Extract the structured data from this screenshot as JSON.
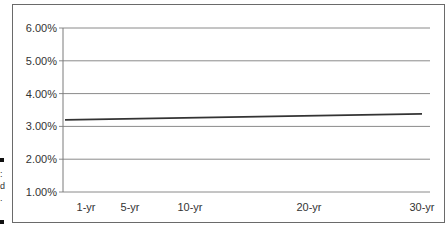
{
  "chart_data": {
    "type": "line",
    "title": "",
    "xlabel": "",
    "ylabel": "",
    "categories": [
      "1-yr",
      "5-yr",
      "10-yr",
      "20-yr",
      "30-yr"
    ],
    "x_years": [
      1,
      5,
      10,
      20,
      30
    ],
    "series": [
      {
        "name": "Yield",
        "x": [
          1,
          30
        ],
        "values": [
          3.2,
          3.38
        ]
      }
    ],
    "yticks": [
      "1.00%",
      "2.00%",
      "3.00%",
      "4.00%",
      "5.00%",
      "6.00%"
    ],
    "ytick_values": [
      1,
      2,
      3,
      4,
      5,
      6
    ],
    "ylim": [
      1,
      6
    ],
    "grid": true,
    "legend": "none",
    "line_color": "#333333",
    "grid_color": "#8a8a8a"
  },
  "caption_fragments": [
    ":",
    "d",
    "."
  ]
}
